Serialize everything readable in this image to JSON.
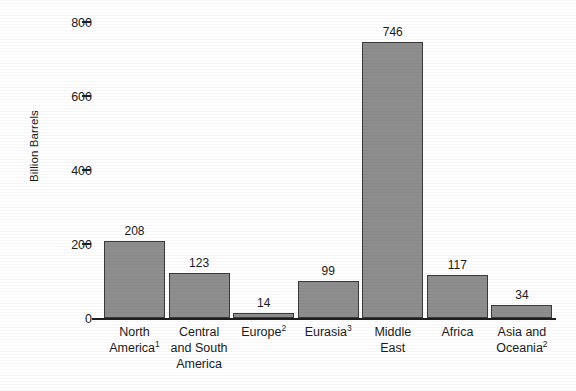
{
  "chart_data": {
    "type": "bar",
    "title": "",
    "xlabel": "",
    "ylabel": "Billion Barrels",
    "ylim": [
      0,
      800
    ],
    "grid": false,
    "legend": null,
    "categories": [
      "North America¹",
      "Central and South America",
      "Europe²",
      "Eurasia³",
      "Middle East",
      "Africa",
      "Asia and Oceania²"
    ],
    "values": [
      208,
      123,
      14,
      99,
      746,
      117,
      34
    ],
    "yticks": [
      0,
      200,
      400,
      600,
      800
    ],
    "ytick_labels": [
      "0",
      "200",
      "400",
      "600",
      "800"
    ],
    "bar_color": "#8e8e8e",
    "bar_edge_color": "#3a3a3a",
    "axis_color": "#1f1f1f",
    "text_color": "#1b1b1b",
    "background": "#ffffff"
  },
  "axis": {
    "y_title": "Billion Barrels",
    "ticks": [
      {
        "label": "800",
        "value": 800
      },
      {
        "label": "600",
        "value": 600
      },
      {
        "label": "400",
        "value": 400
      },
      {
        "label": "200",
        "value": 200
      },
      {
        "label": "0",
        "value": 0
      }
    ]
  },
  "bars": [
    {
      "value_label": "208",
      "value": 208,
      "label_lines": [
        {
          "text": "North",
          "sup": ""
        },
        {
          "text": "America",
          "sup": "1"
        }
      ]
    },
    {
      "value_label": "123",
      "value": 123,
      "label_lines": [
        {
          "text": "Central",
          "sup": ""
        },
        {
          "text": "and South",
          "sup": ""
        },
        {
          "text": "America",
          "sup": ""
        }
      ]
    },
    {
      "value_label": "14",
      "value": 14,
      "label_lines": [
        {
          "text": "Europe",
          "sup": "2"
        }
      ]
    },
    {
      "value_label": "99",
      "value": 99,
      "label_lines": [
        {
          "text": "Eurasia",
          "sup": "3"
        }
      ]
    },
    {
      "value_label": "746",
      "value": 746,
      "label_lines": [
        {
          "text": "Middle",
          "sup": ""
        },
        {
          "text": "East",
          "sup": ""
        }
      ]
    },
    {
      "value_label": "117",
      "value": 117,
      "label_lines": [
        {
          "text": "Africa",
          "sup": ""
        }
      ]
    },
    {
      "value_label": "34",
      "value": 34,
      "label_lines": [
        {
          "text": "Asia and",
          "sup": ""
        },
        {
          "text": "Oceania",
          "sup": "2"
        }
      ]
    }
  ]
}
